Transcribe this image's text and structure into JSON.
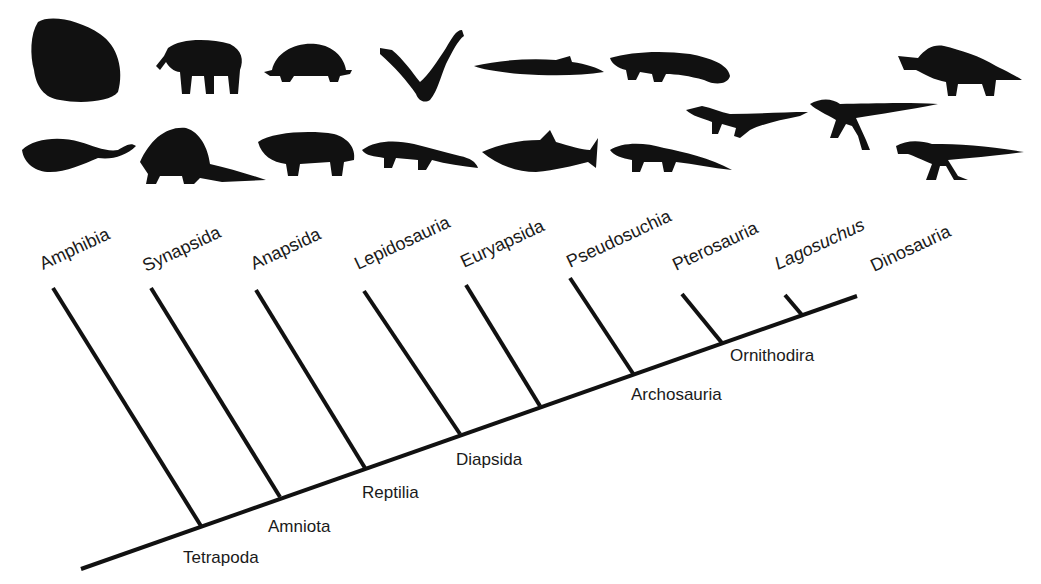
{
  "figure": {
    "type": "cladogram",
    "taxa": [
      {
        "label": "Amphibia",
        "italic": false
      },
      {
        "label": "Synapsida",
        "italic": false
      },
      {
        "label": "Anapsida",
        "italic": false
      },
      {
        "label": "Lepidosauria",
        "italic": false
      },
      {
        "label": "Euryapsida",
        "italic": false
      },
      {
        "label": "Pseudosuchia",
        "italic": false
      },
      {
        "label": "Pterosauria",
        "italic": false
      },
      {
        "label": "Lagosuchus",
        "italic": true
      },
      {
        "label": "Dinosauria",
        "italic": false
      }
    ],
    "nodes": [
      {
        "label": "Tetrapoda"
      },
      {
        "label": "Amniota"
      },
      {
        "label": "Reptilia"
      },
      {
        "label": "Diapsida"
      },
      {
        "label": "Archosauria"
      },
      {
        "label": "Ornithodira"
      }
    ],
    "silhouettes": [
      "frog-silhouette",
      "salamander-silhouette",
      "elephant-silhouette",
      "dimetrodon-silhouette",
      "tortoise-silhouette",
      "pareiasaur-silhouette",
      "plesiosaur-silhouette",
      "lizard-silhouette",
      "ichthyosaur-silhouette",
      "shark-like-ichthyosaur-silhouette",
      "crocodile-silhouette",
      "rauisuchian-silhouette",
      "pterosaur-silhouette",
      "lagosuchus-silhouette",
      "triceratops-silhouette",
      "theropod-silhouette"
    ],
    "line_color": "#111111"
  }
}
